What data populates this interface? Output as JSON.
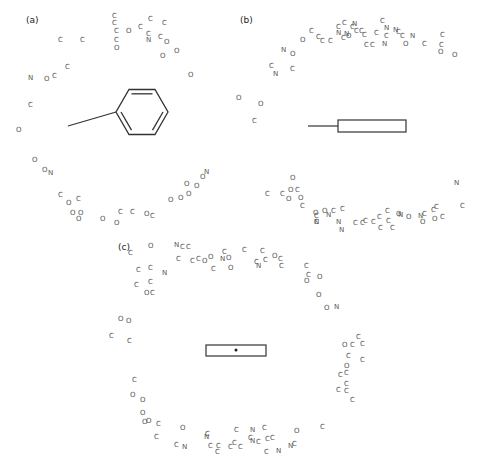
{
  "panels": {
    "a": {
      "label": "(a)",
      "x": 26,
      "y": 23
    },
    "b": {
      "label": "(b)",
      "x": 240,
      "y": 23
    },
    "c": {
      "label": "(c)",
      "x": 118,
      "y": 250
    }
  },
  "atoms": [
    [
      "C",
      60,
      40
    ],
    [
      "C",
      82,
      40
    ],
    [
      "C",
      114,
      16
    ],
    [
      "C",
      114,
      23
    ],
    [
      "C",
      116,
      31
    ],
    [
      "O",
      128,
      31
    ],
    [
      "C",
      140,
      27
    ],
    [
      "C",
      150,
      19
    ],
    [
      "C",
      164,
      23
    ],
    [
      "C",
      148,
      34
    ],
    [
      "N",
      148,
      40
    ],
    [
      "C",
      116,
      40
    ],
    [
      "O",
      116,
      48
    ],
    [
      "C",
      160,
      37
    ],
    [
      "O",
      166,
      42
    ],
    [
      "O",
      162,
      56
    ],
    [
      "O",
      176,
      51
    ],
    [
      "O",
      190,
      75
    ],
    [
      "N",
      30,
      78
    ],
    [
      "O",
      46,
      79
    ],
    [
      "C",
      54,
      76
    ],
    [
      "C",
      67,
      67
    ],
    [
      "C",
      30,
      105
    ],
    [
      "O",
      18,
      130
    ],
    [
      "O",
      34,
      160
    ],
    [
      "O",
      44,
      170
    ],
    [
      "N",
      50,
      173
    ],
    [
      "C",
      60,
      195
    ],
    [
      "O",
      68,
      203
    ],
    [
      "C",
      78,
      199
    ],
    [
      "O",
      72,
      213
    ],
    [
      "O",
      80,
      213
    ],
    [
      "O",
      78,
      219
    ],
    [
      "O",
      102,
      219
    ],
    [
      "C",
      120,
      212
    ],
    [
      "O",
      116,
      223
    ],
    [
      "C",
      132,
      212
    ],
    [
      "O",
      146,
      214
    ],
    [
      "C",
      152,
      216
    ],
    [
      "O",
      170,
      200
    ],
    [
      "O",
      180,
      198
    ],
    [
      "O",
      188,
      194
    ],
    [
      "O",
      186,
      184
    ],
    [
      "O",
      196,
      186
    ],
    [
      "O",
      202,
      177
    ],
    [
      "N",
      206,
      172
    ],
    [
      "N",
      283,
      50
    ],
    [
      "O",
      292,
      54
    ],
    [
      "C",
      271,
      66
    ],
    [
      "N",
      275,
      74
    ],
    [
      "C",
      292,
      69
    ],
    [
      "O",
      302,
      40
    ],
    [
      "C",
      311,
      31
    ],
    [
      "C",
      318,
      37
    ],
    [
      "C",
      322,
      41
    ],
    [
      "C",
      330,
      41
    ],
    [
      "C",
      338,
      27
    ],
    [
      "C",
      343,
      38
    ],
    [
      "N",
      338,
      33
    ],
    [
      "C",
      344,
      23
    ],
    [
      "C",
      352,
      27
    ],
    [
      "N",
      354,
      24
    ],
    [
      "C",
      356,
      31
    ],
    [
      "N",
      346,
      34
    ],
    [
      "C",
      361,
      31
    ],
    [
      "C",
      364,
      35
    ],
    [
      "C",
      366,
      45
    ],
    [
      "C",
      372,
      45
    ],
    [
      "C",
      376,
      33
    ],
    [
      "C",
      386,
      36
    ],
    [
      "O",
      348,
      36
    ],
    [
      "C",
      382,
      21
    ],
    [
      "N",
      386,
      28
    ],
    [
      "N",
      395,
      30
    ],
    [
      "C",
      398,
      32
    ],
    [
      "C",
      402,
      36
    ],
    [
      "N",
      412,
      36
    ],
    [
      "N",
      384,
      44
    ],
    [
      "O",
      405,
      44
    ],
    [
      "C",
      424,
      44
    ],
    [
      "C",
      442,
      35
    ],
    [
      "C",
      441,
      45
    ],
    [
      "O",
      440,
      52
    ],
    [
      "O",
      454,
      55
    ],
    [
      "O",
      238,
      98
    ],
    [
      "O",
      260,
      104
    ],
    [
      "C",
      254,
      121
    ],
    [
      "O",
      292,
      178
    ],
    [
      "C",
      267,
      194
    ],
    [
      "C",
      282,
      194
    ],
    [
      "O",
      290,
      190
    ],
    [
      "C",
      297,
      190
    ],
    [
      "O",
      288,
      199
    ],
    [
      "O",
      300,
      198
    ],
    [
      "C",
      302,
      206
    ],
    [
      "C",
      316,
      216
    ],
    [
      "C",
      316,
      222
    ],
    [
      "N",
      316,
      222
    ],
    [
      "O",
      315,
      213
    ],
    [
      "N",
      328,
      215
    ],
    [
      "O",
      324,
      211
    ],
    [
      "C",
      333,
      211
    ],
    [
      "C",
      342,
      209
    ],
    [
      "N",
      338,
      222
    ],
    [
      "N",
      341,
      230
    ],
    [
      "C",
      355,
      223
    ],
    [
      "C",
      362,
      223
    ],
    [
      "C",
      365,
      221
    ],
    [
      "C",
      373,
      222
    ],
    [
      "C",
      379,
      217
    ],
    [
      "C",
      387,
      211
    ],
    [
      "C",
      388,
      221
    ],
    [
      "C",
      380,
      228
    ],
    [
      "C",
      392,
      228
    ],
    [
      "O",
      398,
      214
    ],
    [
      "N",
      400,
      215
    ],
    [
      "O",
      408,
      217
    ],
    [
      "N",
      420,
      216
    ],
    [
      "C",
      424,
      214
    ],
    [
      "C",
      433,
      210
    ],
    [
      "O",
      422,
      222
    ],
    [
      "C",
      436,
      207
    ],
    [
      "O",
      434,
      219
    ],
    [
      "C",
      442,
      217
    ],
    [
      "N",
      456,
      183
    ],
    [
      "C",
      462,
      206
    ],
    [
      "C",
      130,
      253
    ],
    [
      "O",
      150,
      246
    ],
    [
      "N",
      176,
      245
    ],
    [
      "C",
      182,
      247
    ],
    [
      "C",
      188,
      247
    ],
    [
      "C",
      138,
      270
    ],
    [
      "C",
      150,
      268
    ],
    [
      "N",
      164,
      273
    ],
    [
      "C",
      136,
      285
    ],
    [
      "C",
      150,
      282
    ],
    [
      "O",
      146,
      293
    ],
    [
      "C",
      152,
      293
    ],
    [
      "C",
      178,
      259
    ],
    [
      "C",
      192,
      261
    ],
    [
      "C",
      198,
      259
    ],
    [
      "O",
      204,
      261
    ],
    [
      "O",
      210,
      257
    ],
    [
      "C",
      213,
      269
    ],
    [
      "C",
      224,
      252
    ],
    [
      "N",
      222,
      259
    ],
    [
      "O",
      228,
      258
    ],
    [
      "O",
      230,
      268
    ],
    [
      "C",
      244,
      250
    ],
    [
      "C",
      262,
      251
    ],
    [
      "C",
      256,
      262
    ],
    [
      "N",
      258,
      266
    ],
    [
      "C",
      265,
      260
    ],
    [
      "O",
      274,
      256
    ],
    [
      "C",
      280,
      259
    ],
    [
      "C",
      281,
      266
    ],
    [
      "C",
      306,
      266
    ],
    [
      "C",
      308,
      275
    ],
    [
      "O",
      306,
      281
    ],
    [
      "O",
      319,
      277
    ],
    [
      "O",
      318,
      295
    ],
    [
      "O",
      326,
      308
    ],
    [
      "N",
      336,
      307
    ],
    [
      "O",
      120,
      319
    ],
    [
      "O",
      128,
      321
    ],
    [
      "C",
      111,
      336
    ],
    [
      "C",
      129,
      341
    ],
    [
      "C",
      134,
      380
    ],
    [
      "O",
      132,
      395
    ],
    [
      "O",
      142,
      400
    ],
    [
      "O",
      142,
      413
    ],
    [
      "O",
      144,
      422
    ],
    [
      "O",
      148,
      421
    ],
    [
      "C",
      158,
      424
    ],
    [
      "C",
      156,
      437
    ],
    [
      "O",
      182,
      428
    ],
    [
      "C",
      176,
      445
    ],
    [
      "N",
      184,
      447
    ],
    [
      "C",
      207,
      434
    ],
    [
      "N",
      206,
      437
    ],
    [
      "C",
      210,
      446
    ],
    [
      "C",
      218,
      446
    ],
    [
      "C",
      217,
      452
    ],
    [
      "C",
      230,
      447
    ],
    [
      "C",
      234,
      443
    ],
    [
      "C",
      240,
      447
    ],
    [
      "C",
      236,
      430
    ],
    [
      "N",
      252,
      430
    ],
    [
      "C",
      264,
      428
    ],
    [
      "C",
      250,
      438
    ],
    [
      "N",
      252,
      441
    ],
    [
      "C",
      258,
      442
    ],
    [
      "C",
      267,
      439
    ],
    [
      "C",
      272,
      438
    ],
    [
      "C",
      266,
      452
    ],
    [
      "N",
      278,
      451
    ],
    [
      "N",
      290,
      446
    ],
    [
      "C",
      294,
      444
    ],
    [
      "O",
      296,
      431
    ],
    [
      "C",
      322,
      427
    ],
    [
      "C",
      358,
      337
    ],
    [
      "O",
      344,
      345
    ],
    [
      "C",
      352,
      345
    ],
    [
      "C",
      362,
      344
    ],
    [
      "C",
      348,
      356
    ],
    [
      "C",
      362,
      360
    ],
    [
      "O",
      346,
      366
    ],
    [
      "C",
      340,
      375
    ],
    [
      "C",
      346,
      373
    ],
    [
      "C",
      346,
      384
    ],
    [
      "C",
      338,
      390
    ],
    [
      "C",
      346,
      391
    ],
    [
      "C",
      352,
      400
    ]
  ],
  "structures": {
    "a": {
      "type": "benzene-ring-with-bond",
      "ring_center": [
        142,
        112
      ],
      "ring_radius": 26,
      "bond_from": [
        68,
        127
      ],
      "bond_to": [
        96,
        127
      ]
    },
    "b": {
      "type": "rectangle-with-bond",
      "bond_from": [
        308,
        126
      ],
      "bond_to": [
        338,
        126
      ],
      "rect": [
        338,
        120,
        68,
        12
      ]
    },
    "c": {
      "type": "rectangle-with-dot",
      "rect": [
        206,
        345,
        60,
        11
      ],
      "dot": [
        236,
        350
      ]
    }
  }
}
